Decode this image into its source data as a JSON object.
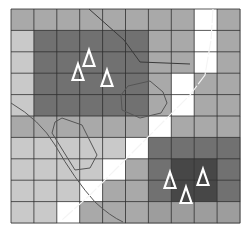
{
  "map": {
    "grid": {
      "x0": 11,
      "y0": 9,
      "cols": 10,
      "rows": 10,
      "cell_w": 22.9,
      "cell_h": 21.4,
      "line_color": "#2f2f2f",
      "palette": {
        "W": "#ffffff",
        "L": "#c9c9c9",
        "M": "#a9a9a9",
        "G": "#9d9d9d",
        "D": "#717171",
        "K": "#474747"
      },
      "cells": [
        [
          "M",
          "M",
          "M",
          "M",
          "M",
          "M",
          "M",
          "M",
          "W",
          "M"
        ],
        [
          "L",
          "D",
          "D",
          "D",
          "D",
          "D",
          "M",
          "M",
          "W",
          "M"
        ],
        [
          "L",
          "D",
          "D",
          "D",
          "D",
          "D",
          "M",
          "M",
          "W",
          "M"
        ],
        [
          "L",
          "D",
          "D",
          "D",
          "D",
          "D",
          "M",
          "W",
          "M",
          "M"
        ],
        [
          "L",
          "D",
          "D",
          "D",
          "D",
          "D",
          "M",
          "W",
          "M",
          "M"
        ],
        [
          "M",
          "M",
          "M",
          "M",
          "M",
          "M",
          "W",
          "M",
          "M",
          "M"
        ],
        [
          "L",
          "L",
          "L",
          "L",
          "L",
          "W",
          "D",
          "D",
          "D",
          "D"
        ],
        [
          "L",
          "L",
          "L",
          "L",
          "W",
          "M",
          "D",
          "K",
          "K",
          "D"
        ],
        [
          "L",
          "L",
          "L",
          "W",
          "M",
          "M",
          "D",
          "K",
          "K",
          "D"
        ],
        [
          "L",
          "L",
          "W",
          "M",
          "M",
          "M",
          "G",
          "G",
          "G",
          "G"
        ]
      ]
    },
    "markers": [
      {
        "type": "triangle",
        "x": 89,
        "y": 58
      },
      {
        "type": "triangle",
        "x": 78,
        "y": 72
      },
      {
        "type": "triangle",
        "x": 107,
        "y": 78
      },
      {
        "type": "triangle",
        "x": 170,
        "y": 180
      },
      {
        "type": "triangle",
        "x": 203,
        "y": 177
      },
      {
        "type": "triangle",
        "x": 186,
        "y": 195
      }
    ],
    "lines": {
      "boundary_curve_top": "M89,9 L124,40 L140,62 L190,64",
      "boundary_curve_left": "M11,103 Q40,120 55,145 Q75,180 95,202 Q110,216 123,222",
      "polygon_right": "128,86 150,81 163,92 167,103 161,113 140,118 122,110 121,95",
      "polygon_left": "62,118 82,125 97,155 90,168 75,170 52,133 55,122",
      "diagonal_path": "M213,9 L211,40 L205,75 L190,95 L165,120 L140,145 L115,170 L90,195 L62,220"
    },
    "colors": {
      "marker_stroke": "#ffffff",
      "line_color": "#555555",
      "diagonal_color": "#f4f4f4"
    }
  }
}
